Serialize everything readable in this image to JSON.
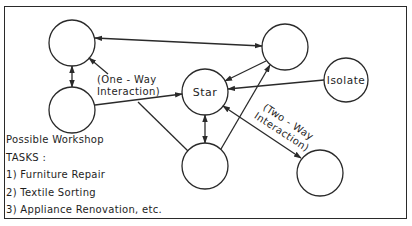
{
  "diagram": {
    "stroke_color": "#2a2a2a",
    "background": "#ffffff",
    "nodes": [
      {
        "id": "n_topleft",
        "label": "",
        "cx": 72,
        "cy": 43,
        "r": 23
      },
      {
        "id": "n_midleft",
        "label": "",
        "cx": 72,
        "cy": 110,
        "r": 23
      },
      {
        "id": "n_star",
        "label": "Star",
        "cx": 205,
        "cy": 92,
        "r": 23
      },
      {
        "id": "n_topright",
        "label": "",
        "cx": 285,
        "cy": 47,
        "r": 23
      },
      {
        "id": "n_isolate",
        "label": "Isolate",
        "cx": 346,
        "cy": 80,
        "r": 22
      },
      {
        "id": "n_bottomcenter",
        "label": "",
        "cx": 205,
        "cy": 166,
        "r": 23
      },
      {
        "id": "n_bottomright",
        "label": "",
        "cx": 320,
        "cy": 173,
        "r": 23
      }
    ],
    "edges": [
      {
        "from": "n_topleft",
        "to": "n_topright",
        "arrows": "both"
      },
      {
        "from": "n_topleft",
        "to": "n_midleft",
        "arrows": "both"
      },
      {
        "from": "n_midleft",
        "to": "n_star",
        "arrows": "end"
      },
      {
        "from": "n_topright",
        "to": "n_star",
        "arrows": "end"
      },
      {
        "from": "n_isolate",
        "to": "n_star",
        "arrows": "end"
      },
      {
        "from": "n_bottomcenter",
        "to": "n_topright",
        "arrows": "end"
      },
      {
        "from": "n_star",
        "to": "n_bottomcenter",
        "arrows": "both"
      },
      {
        "from": "n_star",
        "to": "n_bottomright",
        "arrows": "both"
      },
      {
        "from": "label_oneway",
        "to": "n_topleft",
        "arrows": "end"
      },
      {
        "from": "n_midleft_line",
        "to": "n_bottomcenter",
        "arrows": "none"
      }
    ],
    "labels": {
      "star": "Star",
      "isolate": "Isolate",
      "one_way_line1": "(One - Way",
      "one_way_line2": "Interaction)",
      "two_way_line1": "(Two - Way",
      "two_way_line2": "Interaction)"
    },
    "caption": {
      "heading1": "Possible  Workshop",
      "heading2": "TASKS :",
      "tasks": [
        "1) Furniture  Repair",
        "2) Textile  Sorting",
        "3) Appliance  Renovation, etc."
      ]
    }
  }
}
